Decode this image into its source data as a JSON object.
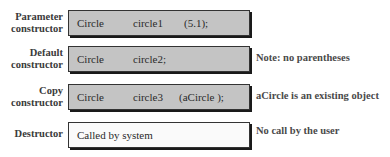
{
  "rows": [
    {
      "label_line1": "Parameter",
      "label_line2": "constructor",
      "type": "Circle",
      "name": "circle1",
      "args": "(5.1);",
      "note": ""
    },
    {
      "label_line1": "Default",
      "label_line2": "constructor",
      "type": "Circle",
      "name": "circle2;",
      "args": "",
      "note": "Note: no parentheses"
    },
    {
      "label_line1": "Copy",
      "label_line2": "constructor",
      "type": "Circle",
      "name": "circle3",
      "args": "(aCircle );",
      "note": "aCircle is an existing object"
    },
    {
      "label_line1": "Destructor",
      "text": "Called by system",
      "note": "No call by the user"
    }
  ]
}
